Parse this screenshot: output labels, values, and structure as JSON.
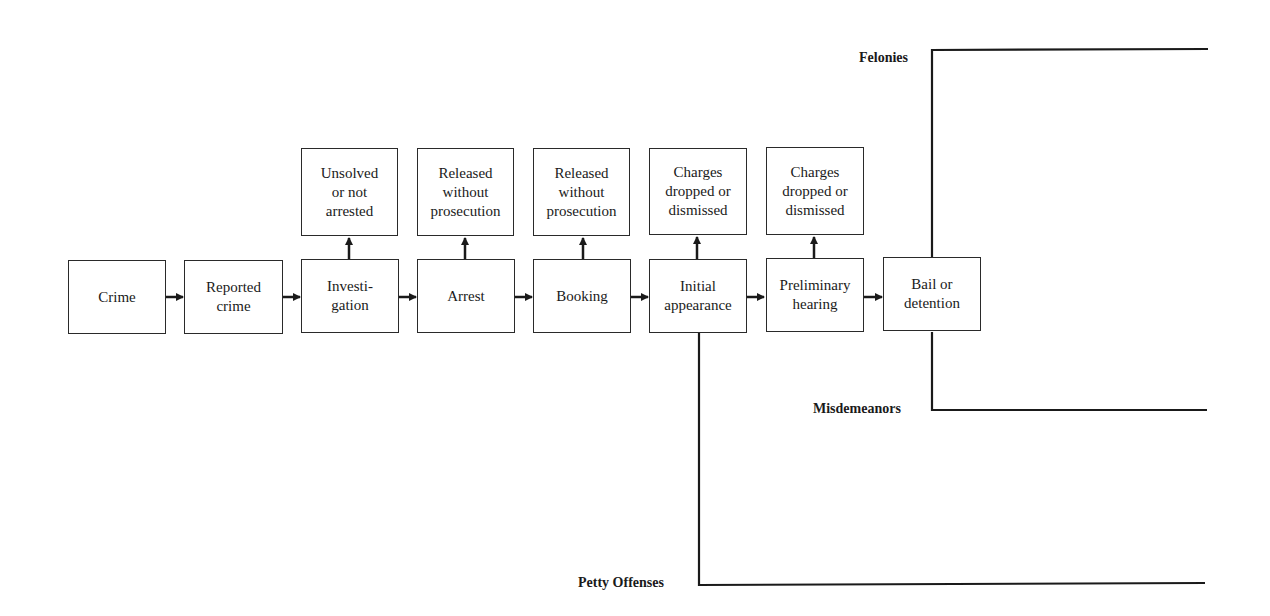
{
  "flow": {
    "main_steps": [
      {
        "id": "crime",
        "label": "Crime"
      },
      {
        "id": "reported-crime",
        "label": "Reported\ncrime"
      },
      {
        "id": "investigation",
        "label": "Investi-\ngation"
      },
      {
        "id": "arrest",
        "label": "Arrest"
      },
      {
        "id": "booking",
        "label": "Booking"
      },
      {
        "id": "initial-appearance",
        "label": "Initial\nappearance"
      },
      {
        "id": "preliminary-hearing",
        "label": "Preliminary\nhearing"
      },
      {
        "id": "bail-or-detention",
        "label": "Bail or\ndetention"
      }
    ],
    "exits": [
      {
        "from": "investigation",
        "label": "Unsolved\nor not\narrested"
      },
      {
        "from": "arrest",
        "label": "Released\nwithout\nprosecution"
      },
      {
        "from": "booking",
        "label": "Released\nwithout\nprosecution"
      },
      {
        "from": "initial-appearance",
        "label": "Charges\ndropped or\ndismissed"
      },
      {
        "from": "preliminary-hearing",
        "label": "Charges\ndropped or\ndismissed"
      }
    ],
    "branches": {
      "felonies": "Felonies",
      "misdemeanors": "Misdemeanors",
      "petty_offenses": "Petty Offenses"
    }
  },
  "colors": {
    "line": "#1a1a1a",
    "background": "#ffffff"
  }
}
